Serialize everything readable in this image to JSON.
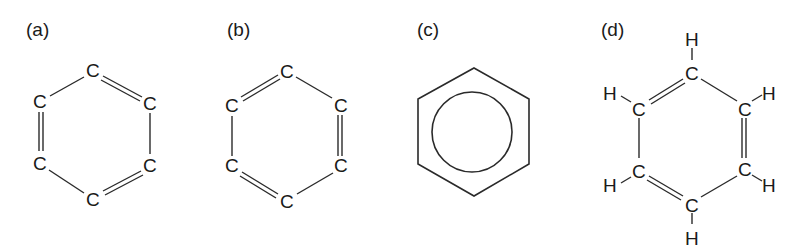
{
  "figure": {
    "panels": [
      {
        "label": "(a)",
        "type": "kekule-carbon-only",
        "atoms": [
          "C",
          "C",
          "C",
          "C",
          "C",
          "C"
        ],
        "double_bonds": [
          "top-upperright",
          "lowerright-bottom",
          "lowerleft-upperleft"
        ]
      },
      {
        "label": "(b)",
        "type": "kekule-carbon-only-alternate",
        "atoms": [
          "C",
          "C",
          "C",
          "C",
          "C",
          "C"
        ],
        "double_bonds": [
          "upperleft-top",
          "upperright-lowerright",
          "lowerleft-bottom"
        ]
      },
      {
        "label": "(c)",
        "type": "hexagon-with-circle",
        "atoms": []
      },
      {
        "label": "(d)",
        "type": "kekule-with-hydrogens",
        "atoms": [
          "C",
          "C",
          "C",
          "C",
          "C",
          "C"
        ],
        "hydrogens": [
          "H",
          "H",
          "H",
          "H",
          "H",
          "H"
        ],
        "double_bonds": [
          "upperleft-top",
          "upperright-lowerright",
          "lowerleft-bottom"
        ]
      }
    ]
  },
  "atom_symbol_carbon": "C",
  "atom_symbol_hydrogen": "H"
}
